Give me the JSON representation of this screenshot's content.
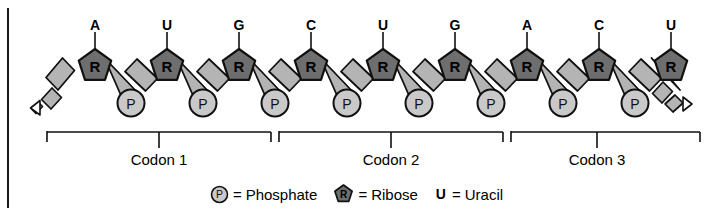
{
  "figure": {
    "name": "rna-codon-diagram",
    "colors": {
      "ribose_fill": "#6e6e6e",
      "phosphate_fill": "#c9c9c9",
      "backbone_fill": "#b4b4b4",
      "outline": "#111111",
      "background": "#ffffff",
      "frame_edge": "#1a1a1a"
    },
    "strand": {
      "ribose_label": "R",
      "phosphate_label": "P",
      "ribose_count": 9,
      "phosphate_count": 8,
      "left_end": "dashed-continuation-arrow",
      "right_end": "dashed-continuation-arrow"
    },
    "bases": [
      {
        "label": "A",
        "codon": 1
      },
      {
        "label": "U",
        "codon": 1
      },
      {
        "label": "G",
        "codon": 1
      },
      {
        "label": "C",
        "codon": 2
      },
      {
        "label": "U",
        "codon": 2
      },
      {
        "label": "G",
        "codon": 2
      },
      {
        "label": "A",
        "codon": 3
      },
      {
        "label": "C",
        "codon": 3
      },
      {
        "label": "U",
        "codon": 3
      }
    ],
    "codons": [
      {
        "label": "Codon 1"
      },
      {
        "label": "Codon 2"
      },
      {
        "label": "Codon 3"
      }
    ],
    "legend": [
      {
        "icon": "phosphate-circle-icon",
        "symbol": "P",
        "equals": "=",
        "text": "Phosphate"
      },
      {
        "icon": "ribose-pentagon-icon",
        "symbol": "R",
        "equals": "=",
        "text": "Ribose"
      },
      {
        "icon": "uracil-letter",
        "symbol": "U",
        "equals": "=",
        "text": "Uracil"
      }
    ]
  }
}
